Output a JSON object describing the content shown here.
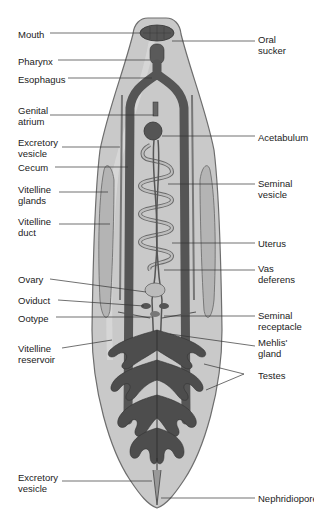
{
  "figure": {
    "colors": {
      "body_fill": "#c9c9c9",
      "body_edge": "#6e6e6e",
      "organ_dark": "#4a4a4a",
      "organ_mid": "#5e5e5e",
      "gland_light": "#b4b4b4",
      "leader": "#333333",
      "text": "#222222"
    }
  },
  "labels_left": [
    {
      "id": "mouth",
      "text": "Mouth",
      "y": 29
    },
    {
      "id": "pharynx",
      "text": "Pharynx",
      "y": 56
    },
    {
      "id": "esophagus",
      "text": "Esophagus",
      "y": 74
    },
    {
      "id": "genital-atrium",
      "text": "Genital\natrium",
      "y": 105
    },
    {
      "id": "excretory-vesicle-top",
      "text": "Excretory\nvesicle",
      "y": 137
    },
    {
      "id": "cecum",
      "text": "Cecum",
      "y": 162
    },
    {
      "id": "vitelline-glands",
      "text": "Vitelline\nglands",
      "y": 184
    },
    {
      "id": "vitelline-duct",
      "text": "Vitelline\nduct",
      "y": 216
    },
    {
      "id": "ovary",
      "text": "Ovary",
      "y": 274
    },
    {
      "id": "oviduct",
      "text": "Oviduct",
      "y": 295
    },
    {
      "id": "ootype",
      "text": "Ootype",
      "y": 313
    },
    {
      "id": "vitelline-reservoir",
      "text": "Vitelline\nreservoir",
      "y": 343
    },
    {
      "id": "excretory-vesicle-bottom",
      "text": "Excretory\nvesicle",
      "y": 472
    }
  ],
  "labels_right": [
    {
      "id": "oral-sucker",
      "text": "Oral\nsucker",
      "y": 34
    },
    {
      "id": "acetabulum",
      "text": "Acetabulum",
      "y": 132
    },
    {
      "id": "seminal-vesicle",
      "text": "Seminal\nvesicle",
      "y": 178
    },
    {
      "id": "uterus",
      "text": "Uterus",
      "y": 238
    },
    {
      "id": "vas-deferens",
      "text": "Vas\ndeferens",
      "y": 263
    },
    {
      "id": "seminal-receptacle",
      "text": "Seminal\nreceptacle",
      "y": 310
    },
    {
      "id": "mehlis-gland",
      "text": "Mehlis'\ngland",
      "y": 337
    },
    {
      "id": "testes",
      "text": "Testes",
      "y": 370
    },
    {
      "id": "nephridiopore",
      "text": "Nephridiopore",
      "y": 498
    }
  ]
}
